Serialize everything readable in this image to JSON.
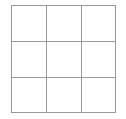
{
  "figure": {
    "kind": "grid-diagram",
    "title": "",
    "canvas": {
      "width": 126,
      "height": 119,
      "background_color": "#ffffff"
    },
    "grid": {
      "name": "3x3-grid",
      "rows": 3,
      "columns": 3,
      "cell_count": 9,
      "bounds": {
        "left": 11,
        "top": 5,
        "right": 116,
        "bottom": 113
      },
      "cell_width": 35,
      "cell_height": 36,
      "line_color": "#999999",
      "line_width": 1,
      "fill_color": "#ffffff",
      "vertical_line_x": [
        11,
        46,
        81,
        116
      ],
      "horizontal_line_y": [
        5,
        41,
        77,
        113
      ],
      "cells": [
        {
          "row": 0,
          "col": 0,
          "label": ""
        },
        {
          "row": 0,
          "col": 1,
          "label": ""
        },
        {
          "row": 0,
          "col": 2,
          "label": ""
        },
        {
          "row": 1,
          "col": 0,
          "label": ""
        },
        {
          "row": 1,
          "col": 1,
          "label": ""
        },
        {
          "row": 1,
          "col": 2,
          "label": ""
        },
        {
          "row": 2,
          "col": 0,
          "label": ""
        },
        {
          "row": 2,
          "col": 1,
          "label": ""
        },
        {
          "row": 2,
          "col": 2,
          "label": ""
        }
      ]
    }
  }
}
